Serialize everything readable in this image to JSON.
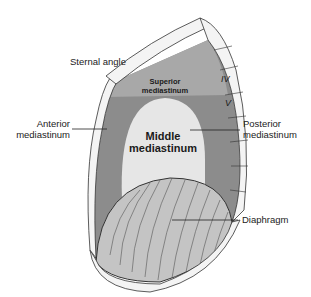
{
  "diagram": {
    "type": "anatomical illustration",
    "labels": {
      "sternal_angle": "Sternal angle",
      "anterior_1": "Anterior",
      "anterior_2": "mediastinum",
      "posterior_1": "Posterior",
      "posterior_2": "mediastinum",
      "diaphragm": "Diaphragm"
    },
    "regions": {
      "superior_1": "Superior",
      "superior_2": "mediastinum",
      "middle_1": "Middle",
      "middle_2": "mediastinum"
    },
    "vertebrae": {
      "iv": "IV",
      "v": "V"
    },
    "colors": {
      "superior": "#a8a8a8",
      "anterior_posterior": "#8c8c8c",
      "middle": "#e6e6e6",
      "diaphragm": "#c4c4c4",
      "bone": "#f4f4f4",
      "outline": "#333333"
    }
  }
}
